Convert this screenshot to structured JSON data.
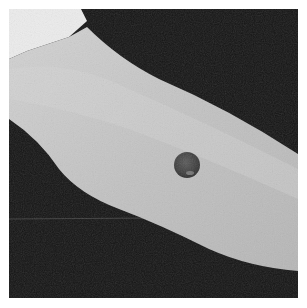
{
  "image": {
    "description": "Black and white photograph of a forearm against a dark background with a single round dark lesion on the skin",
    "subject": "forearm",
    "feature": "round dark lesion",
    "tone": "grayscale",
    "colors": {
      "background": "#141414",
      "skin": "#c4c4c4",
      "skin_highlight": "#dcdcdc",
      "cuff": "#ececec",
      "lesion": "#4a4a4a"
    }
  }
}
